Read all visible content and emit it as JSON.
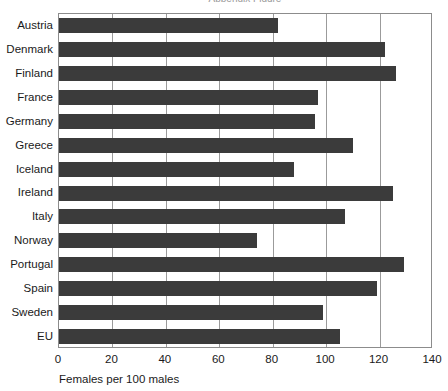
{
  "chart_data": {
    "type": "bar",
    "orientation": "horizontal",
    "title": "",
    "xlabel": "Females per 100 males",
    "ylabel": "",
    "xlim": [
      0,
      140
    ],
    "xticks": [
      0,
      20,
      40,
      60,
      80,
      100,
      120,
      140
    ],
    "grid": "vertical",
    "legend": "none",
    "bar_color": "#3b3b3b",
    "categories": [
      "Austria",
      "Denmark",
      "Finland",
      "France",
      "Germany",
      "Greece",
      "Iceland",
      "Ireland",
      "Italy",
      "Norway",
      "Portugal",
      "Spain",
      "Sweden",
      "EU"
    ],
    "values": [
      82,
      122,
      126,
      97,
      96,
      110,
      88,
      125,
      107,
      74,
      129,
      119,
      99,
      105
    ],
    "series": [
      {
        "name": "Females per 100 males",
        "values": [
          82,
          122,
          126,
          97,
          96,
          110,
          88,
          125,
          107,
          74,
          129,
          119,
          99,
          105
        ]
      }
    ]
  },
  "axes": {
    "tick_labels": [
      "0",
      "20",
      "40",
      "60",
      "80",
      "100",
      "120",
      "140"
    ],
    "x_axis_title": "Females per 100 males"
  },
  "title_sliver": {
    "text": "Appendix Figure"
  }
}
